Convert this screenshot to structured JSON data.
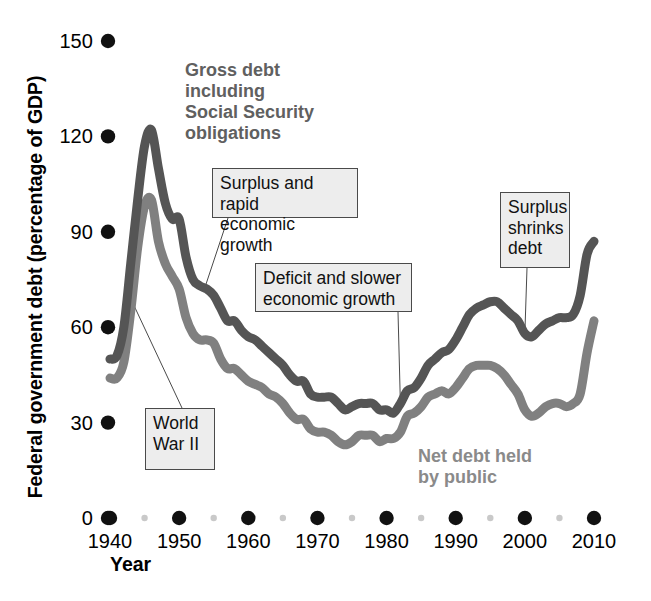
{
  "figure": {
    "y_axis_title": "Federal government debt (percentage of GDP)",
    "x_axis_title": "Year"
  },
  "labels": {
    "gross_series": "Gross debt\nincluding\nSocial Security\nobligations",
    "net_series": "Net debt held\nby public"
  },
  "callouts": [
    {
      "name": "world-war-ii",
      "text": "World\nWar II"
    },
    {
      "name": "surplus-rapid-growth",
      "text": "Surplus and rapid\neconomic growth"
    },
    {
      "name": "deficit-slower-growth",
      "text": "Deficit and slower\neconomic growth"
    },
    {
      "name": "surplus-shrinks-debt",
      "text": "Surplus\nshrinks\ndebt"
    }
  ],
  "colors": {
    "gross_line": "#555555",
    "net_line": "#808080",
    "major_tick_dot": "#111111",
    "minor_tick_dot": "#c9c9c9",
    "callout_fill": "#ededed",
    "callout_border": "#4a4a4a",
    "gross_label_text": "#606060",
    "net_label_text": "#8a8a8a"
  },
  "chart_data": {
    "type": "line",
    "title": "",
    "subtitle": "",
    "xlabel": "Year",
    "ylabel": "Federal government debt (percentage of GDP)",
    "xlim": [
      1938,
      2011
    ],
    "ylim": [
      0,
      150
    ],
    "grid": false,
    "legend": "inline-series-labels",
    "y_ticks": [
      0,
      30,
      60,
      90,
      120,
      150
    ],
    "y_tick_labels": [
      "0",
      "30",
      "60",
      "90",
      "120",
      "150"
    ],
    "x_ticks": [
      1940,
      1950,
      1960,
      1970,
      1980,
      1990,
      2000,
      2010
    ],
    "x_tick_labels": [
      "1940",
      "1950",
      "1960",
      "1970",
      "1980",
      "1990",
      "2000",
      "2010"
    ],
    "x_minor_ticks": [
      1945,
      1955,
      1965,
      1975,
      1985,
      1995,
      2005
    ],
    "x": [
      1940,
      1941,
      1942,
      1943,
      1944,
      1945,
      1946,
      1947,
      1948,
      1949,
      1950,
      1951,
      1952,
      1953,
      1954,
      1955,
      1956,
      1957,
      1958,
      1959,
      1960,
      1961,
      1962,
      1963,
      1964,
      1965,
      1966,
      1967,
      1968,
      1969,
      1970,
      1971,
      1972,
      1973,
      1974,
      1975,
      1976,
      1977,
      1978,
      1979,
      1980,
      1981,
      1982,
      1983,
      1984,
      1985,
      1986,
      1987,
      1988,
      1989,
      1990,
      1991,
      1992,
      1993,
      1994,
      1995,
      1996,
      1997,
      1998,
      1999,
      2000,
      2001,
      2002,
      2003,
      2004,
      2005,
      2006,
      2007,
      2008,
      2009,
      2010
    ],
    "series": [
      {
        "name": "Gross debt including Social Security obligations",
        "color": "#555555",
        "values": [
          50,
          51,
          60,
          80,
          100,
          117,
          122,
          110,
          99,
          94,
          94,
          82,
          75,
          73,
          72,
          70,
          66,
          62,
          62,
          59,
          57,
          56,
          54,
          52,
          50,
          48,
          45,
          43,
          43,
          39,
          38,
          38,
          38,
          36,
          34,
          35,
          36,
          36,
          36,
          34,
          34,
          33,
          36,
          40,
          41,
          44,
          48,
          50,
          52,
          53,
          56,
          60,
          64,
          66,
          67,
          68,
          68,
          66,
          64,
          62,
          58,
          57,
          59,
          61,
          62,
          63,
          63,
          64,
          70,
          83,
          87
        ]
      },
      {
        "name": "Net debt held by public",
        "color": "#808080",
        "values": [
          44,
          44,
          49,
          65,
          85,
          98,
          100,
          87,
          80,
          76,
          72,
          63,
          58,
          56,
          56,
          55,
          50,
          47,
          47,
          45,
          43,
          42,
          41,
          39,
          38,
          36,
          33,
          31,
          31,
          28,
          27,
          27,
          26,
          24,
          23,
          24,
          26,
          26,
          26,
          24,
          25,
          25,
          27,
          32,
          33,
          35,
          38,
          39,
          40,
          39,
          41,
          44,
          47,
          48,
          48,
          48,
          47,
          45,
          42,
          39,
          34,
          32,
          33,
          35,
          36,
          36,
          35,
          36,
          39,
          52,
          62
        ]
      }
    ],
    "annotations": [
      {
        "text": "World War II",
        "points_to_x": 1943,
        "points_to_y": 69
      },
      {
        "text": "Surplus and rapid economic growth",
        "points_to_x": 1953,
        "points_to_y": 71
      },
      {
        "text": "Deficit and slower economic growth",
        "points_to_x": 1982,
        "points_to_y": 36
      },
      {
        "text": "Surplus shrinks debt",
        "points_to_x": 2000,
        "points_to_y": 58
      }
    ]
  }
}
